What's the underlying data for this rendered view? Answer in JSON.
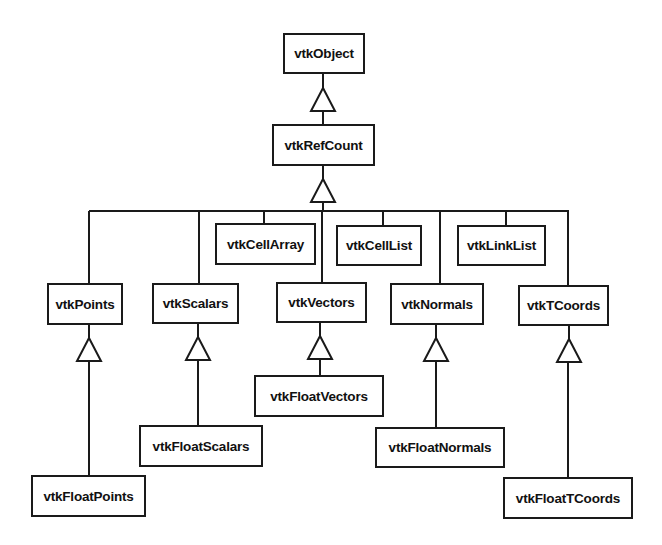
{
  "diagram": {
    "type": "class-inheritance-hierarchy",
    "nodes": {
      "vtkObject": "vtkObject",
      "vtkRefCount": "vtkRefCount",
      "vtkCellArray": "vtkCellArray",
      "vtkCellList": "vtkCellList",
      "vtkLinkList": "vtkLinkList",
      "vtkPoints": "vtkPoints",
      "vtkScalars": "vtkScalars",
      "vtkVectors": "vtkVectors",
      "vtkNormals": "vtkNormals",
      "vtkTCoords": "vtkTCoords",
      "vtkFloatPoints": "vtkFloatPoints",
      "vtkFloatScalars": "vtkFloatScalars",
      "vtkFloatVectors": "vtkFloatVectors",
      "vtkFloatNormals": "vtkFloatNormals",
      "vtkFloatTCoords": "vtkFloatTCoords"
    },
    "edges": [
      {
        "child": "vtkRefCount",
        "parent": "vtkObject"
      },
      {
        "child": "vtkCellArray",
        "parent": "vtkRefCount"
      },
      {
        "child": "vtkCellList",
        "parent": "vtkRefCount"
      },
      {
        "child": "vtkLinkList",
        "parent": "vtkRefCount"
      },
      {
        "child": "vtkPoints",
        "parent": "vtkRefCount"
      },
      {
        "child": "vtkScalars",
        "parent": "vtkRefCount"
      },
      {
        "child": "vtkVectors",
        "parent": "vtkRefCount"
      },
      {
        "child": "vtkNormals",
        "parent": "vtkRefCount"
      },
      {
        "child": "vtkTCoords",
        "parent": "vtkRefCount"
      },
      {
        "child": "vtkFloatPoints",
        "parent": "vtkPoints"
      },
      {
        "child": "vtkFloatScalars",
        "parent": "vtkScalars"
      },
      {
        "child": "vtkFloatVectors",
        "parent": "vtkVectors"
      },
      {
        "child": "vtkFloatNormals",
        "parent": "vtkNormals"
      },
      {
        "child": "vtkFloatTCoords",
        "parent": "vtkTCoords"
      }
    ],
    "colors": {
      "line": "#1a1a1a",
      "background": "#ffffff"
    }
  }
}
